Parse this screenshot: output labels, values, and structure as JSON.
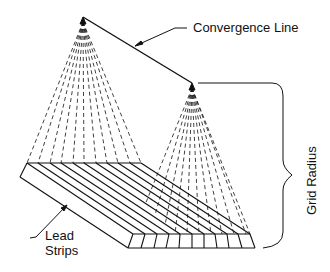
{
  "diagram": {
    "labels": {
      "convergence_line": "Convergence Line",
      "grid_radius": "Grid Radius",
      "lead_strips_line1": "Lead",
      "lead_strips_line2": "Strips"
    },
    "colors": {
      "stroke": "#111111",
      "background": "#ffffff"
    },
    "focal_points": [
      {
        "name": "left-apex",
        "x": 83,
        "y": 18
      },
      {
        "name": "right-apex",
        "x": 192,
        "y": 84
      }
    ],
    "lead_strip_count": 10
  }
}
